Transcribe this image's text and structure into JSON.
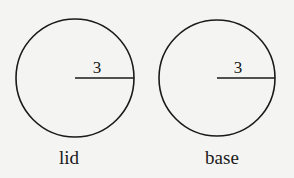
{
  "diagram": {
    "circles": [
      {
        "id": "lid",
        "label": "lid",
        "radius_label": "3",
        "cx": 75,
        "cy": 78,
        "r": 59
      },
      {
        "id": "base",
        "label": "base",
        "radius_label": "3",
        "cx": 217,
        "cy": 78,
        "r": 58
      }
    ],
    "stroke_color": "#1a1a1a",
    "background": "#f4f4f2"
  }
}
